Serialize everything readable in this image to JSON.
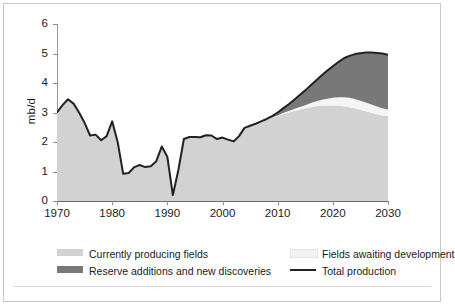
{
  "axes": {
    "ylabel": "mb/d",
    "yticks": [
      "0",
      "1",
      "2",
      "3",
      "4",
      "5",
      "6"
    ],
    "xticks": [
      "1970",
      "1980",
      "1990",
      "2000",
      "2010",
      "2020",
      "2030"
    ]
  },
  "legend": {
    "items": [
      {
        "label": "Currently producing fields",
        "swatch": "area",
        "color": "#d2d2d2"
      },
      {
        "label": "Fields awaiting development",
        "swatch": "area",
        "color": "#f2f2f2"
      },
      {
        "label": "Reserve additions and new discoveries",
        "swatch": "area",
        "color": "#787878"
      },
      {
        "label": "Total production",
        "swatch": "line",
        "color": "#222222"
      }
    ]
  },
  "colors": {
    "currently_producing": "#d2d2d2",
    "awaiting_development": "#f5f5f5",
    "reserve_additions": "#787878",
    "total_line": "#222222",
    "axis": "#8a8a8a",
    "frame": "#c9c9c9",
    "background": "#ffffff"
  },
  "chart_data": {
    "type": "area",
    "stacked": true,
    "title": "",
    "xlabel": "",
    "ylabel": "mb/d",
    "xlim": [
      1970,
      2030
    ],
    "ylim": [
      0,
      6
    ],
    "grid": false,
    "legend_position": "bottom",
    "x": [
      1970,
      1971,
      1972,
      1973,
      1974,
      1975,
      1976,
      1977,
      1978,
      1979,
      1980,
      1981,
      1982,
      1983,
      1984,
      1985,
      1986,
      1987,
      1988,
      1989,
      1990,
      1991,
      1992,
      1993,
      1994,
      1995,
      1996,
      1997,
      1998,
      1999,
      2000,
      2001,
      2002,
      2003,
      2004,
      2005,
      2006,
      2007,
      2008,
      2009,
      2010,
      2011,
      2012,
      2013,
      2014,
      2015,
      2016,
      2017,
      2018,
      2019,
      2020,
      2021,
      2022,
      2023,
      2024,
      2025,
      2026,
      2027,
      2028,
      2029,
      2030
    ],
    "series": [
      {
        "name": "Currently producing fields",
        "color": "#d2d2d2",
        "values": [
          3.0,
          3.25,
          3.45,
          3.3,
          3.0,
          2.65,
          2.22,
          2.25,
          2.06,
          2.2,
          2.7,
          2.0,
          0.92,
          0.95,
          1.15,
          1.22,
          1.15,
          1.18,
          1.35,
          1.85,
          1.5,
          0.2,
          1.05,
          2.1,
          2.17,
          2.17,
          2.16,
          2.23,
          2.22,
          2.1,
          2.15,
          2.08,
          2.02,
          2.2,
          2.48,
          2.55,
          2.62,
          2.7,
          2.76,
          2.82,
          2.88,
          2.95,
          3.0,
          3.05,
          3.1,
          3.14,
          3.18,
          3.21,
          3.23,
          3.24,
          3.24,
          3.23,
          3.21,
          3.18,
          3.14,
          3.09,
          3.04,
          2.99,
          2.94,
          2.9,
          2.88
        ]
      },
      {
        "name": "Fields awaiting development",
        "color": "#f5f5f5",
        "values": [
          0,
          0,
          0,
          0,
          0,
          0,
          0,
          0,
          0,
          0,
          0,
          0,
          0,
          0,
          0,
          0,
          0,
          0,
          0,
          0,
          0,
          0,
          0,
          0,
          0,
          0,
          0,
          0,
          0,
          0,
          0,
          0,
          0,
          0,
          0,
          0,
          0,
          0,
          0,
          0.01,
          0.02,
          0.03,
          0.05,
          0.07,
          0.09,
          0.11,
          0.14,
          0.17,
          0.2,
          0.23,
          0.26,
          0.29,
          0.31,
          0.32,
          0.32,
          0.31,
          0.3,
          0.28,
          0.26,
          0.24,
          0.22
        ]
      },
      {
        "name": "Reserve additions and new discoveries",
        "color": "#787878",
        "values": [
          0,
          0,
          0,
          0,
          0,
          0,
          0,
          0,
          0,
          0,
          0,
          0,
          0,
          0,
          0,
          0,
          0,
          0,
          0,
          0,
          0,
          0,
          0,
          0,
          0,
          0,
          0,
          0,
          0,
          0,
          0,
          0,
          0,
          0,
          0,
          0,
          0,
          0,
          0.02,
          0.05,
          0.1,
          0.16,
          0.23,
          0.31,
          0.4,
          0.5,
          0.6,
          0.71,
          0.83,
          0.95,
          1.07,
          1.19,
          1.31,
          1.42,
          1.52,
          1.61,
          1.69,
          1.76,
          1.82,
          1.86,
          1.86
        ]
      }
    ],
    "total_production": {
      "name": "Total production",
      "color": "#222222",
      "values": [
        3.0,
        3.25,
        3.45,
        3.3,
        3.0,
        2.65,
        2.22,
        2.25,
        2.06,
        2.2,
        2.7,
        2.0,
        0.92,
        0.95,
        1.15,
        1.22,
        1.15,
        1.18,
        1.35,
        1.85,
        1.5,
        0.2,
        1.05,
        2.1,
        2.17,
        2.17,
        2.16,
        2.23,
        2.22,
        2.1,
        2.15,
        2.08,
        2.02,
        2.2,
        2.48,
        2.55,
        2.62,
        2.7,
        2.78,
        2.88,
        3.0,
        3.14,
        3.28,
        3.43,
        3.59,
        3.75,
        3.92,
        4.09,
        4.26,
        4.42,
        4.57,
        4.71,
        4.84,
        4.92,
        4.98,
        5.01,
        5.03,
        5.03,
        5.02,
        5.0,
        4.96
      ]
    },
    "annotations": {
      "forecast_starts": 2008,
      "historical_peak": {
        "year": 1972,
        "value": 3.45
      },
      "historical_low": {
        "year": 1991,
        "value": 0.2
      },
      "final_total": {
        "year": 2030,
        "value": 4.96
      }
    }
  }
}
